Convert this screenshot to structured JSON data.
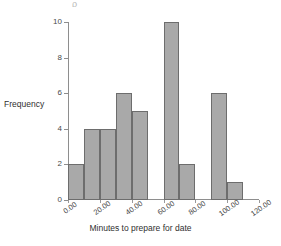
{
  "figure": {
    "top_artifact": "ρ",
    "background_color": "#ffffff",
    "bar_fill_color": "#a9a9a9",
    "bar_border_color": "#6d6d6d",
    "axis_color": "#8e8e8e"
  },
  "chart_data": {
    "type": "bar",
    "title": "",
    "xlabel": "Minutes to prepare for date",
    "ylabel": "Frequency",
    "xlim": [
      0,
      120
    ],
    "ylim": [
      0,
      10
    ],
    "grid": false,
    "legend": null,
    "bin_width": 10,
    "categories": [
      "0-10",
      "10-20",
      "20-30",
      "30-40",
      "40-50",
      "50-60",
      "60-70",
      "70-80",
      "80-90",
      "90-100",
      "100-110"
    ],
    "bin_starts": [
      0,
      10,
      20,
      30,
      40,
      50,
      60,
      70,
      80,
      90,
      100
    ],
    "values": [
      2,
      4,
      4,
      6,
      5,
      0,
      10,
      2,
      0,
      6,
      1
    ],
    "xticks": [
      0,
      20,
      40,
      60,
      80,
      100,
      120
    ],
    "xtick_labels": [
      "0.00",
      "20.00",
      "40.00",
      "60.00",
      "80.00",
      "100.00",
      "120.00"
    ],
    "yticks": [
      0,
      2,
      4,
      6,
      8,
      10
    ],
    "ytick_labels": [
      "0",
      "2",
      "4",
      "6",
      "8",
      "10"
    ]
  }
}
